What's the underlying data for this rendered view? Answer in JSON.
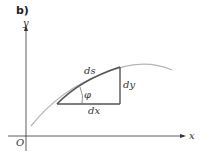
{
  "figure": {
    "panel_label": "b)",
    "axes": {
      "x_label": "x",
      "y_label": "y",
      "origin_label": "O"
    },
    "labels": {
      "arc": "ds",
      "horizontal": "dx",
      "vertical": "dy",
      "angle": "φ"
    },
    "colors": {
      "curve": "#b0b0b0",
      "highlight": "#555555",
      "axis": "#333333",
      "triangle": "#555555"
    }
  }
}
